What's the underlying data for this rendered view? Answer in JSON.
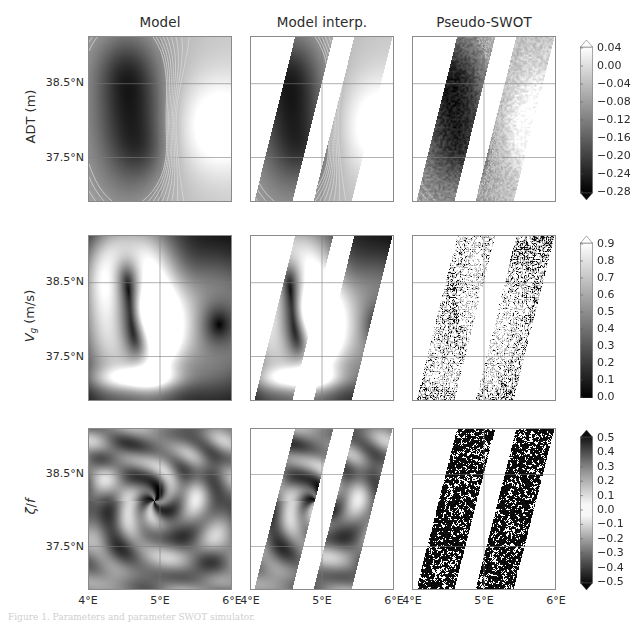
{
  "figure": {
    "width": 634,
    "height": 629,
    "background": "#ffffff",
    "caption": "Figure 1. Parameters and parameter SWOT simulator."
  },
  "columns": [
    {
      "id": "model",
      "title": "Model",
      "x": 88,
      "width": 144
    },
    {
      "id": "model-interp",
      "title": "Model interp.",
      "x": 250,
      "width": 144
    },
    {
      "id": "pseudo-swot",
      "title": "Pseudo-SWOT",
      "x": 412,
      "width": 144
    }
  ],
  "rows": [
    {
      "id": "adt",
      "label": "ADT (m)",
      "label_html": "ADT (m)",
      "y": 36,
      "height": 166,
      "variable": "ADT",
      "units": "m"
    },
    {
      "id": "vg",
      "label": "V_g (m/s)",
      "label_html": "<i>V</i><sub>g</sub> (m/s)",
      "y": 235,
      "height": 166,
      "variable": "Geostrophic velocity",
      "units": "m/s"
    },
    {
      "id": "zeta-f",
      "label": "ζ/f",
      "label_html": "<i>ζ</i>/<i>f</i>",
      "y": 428,
      "height": 162,
      "variable": "Relative vorticity over Coriolis",
      "units": ""
    }
  ],
  "axes": {
    "xticks": [
      {
        "label": "4°E",
        "value": 4,
        "frac": 0.0
      },
      {
        "label": "5°E",
        "value": 5,
        "frac": 0.5
      },
      {
        "label": "6°E",
        "value": 6,
        "frac": 1.0
      }
    ],
    "yticks": [
      {
        "label": "38.5°N",
        "value": 38.5,
        "frac": 0.285
      },
      {
        "label": "37.5°N",
        "value": 37.5,
        "frac": 0.735
      }
    ],
    "xlim": [
      4,
      6
    ],
    "ylim": [
      37.0,
      39.0
    ],
    "grid": true,
    "grid_color": "#7d7d7d"
  },
  "colorbars": [
    {
      "id": "cbar-adt",
      "row": "adt",
      "x": 580,
      "y": 40,
      "width": 13,
      "height": 160,
      "extend": "both",
      "vmin": -0.3,
      "vmax": 0.06,
      "cmap": "gray",
      "ticks": [
        "0.04",
        "0.00",
        "−0.04",
        "−0.08",
        "−0.12",
        "−0.16",
        "−0.20",
        "−0.24",
        "−0.28"
      ],
      "tick_values": [
        0.04,
        0.0,
        -0.04,
        -0.08,
        -0.12,
        -0.16,
        -0.2,
        -0.24,
        -0.28
      ]
    },
    {
      "id": "cbar-vg",
      "row": "vg",
      "x": 580,
      "y": 236,
      "width": 13,
      "height": 162,
      "extend": "max",
      "vmin": 0.0,
      "vmax": 0.95,
      "cmap": "gray",
      "ticks": [
        "0.9",
        "0.8",
        "0.7",
        "0.6",
        "0.5",
        "0.4",
        "0.3",
        "0.2",
        "0.1",
        "0.0"
      ],
      "tick_values": [
        0.9,
        0.8,
        0.7,
        0.6,
        0.5,
        0.4,
        0.3,
        0.2,
        0.1,
        0.0
      ]
    },
    {
      "id": "cbar-zeta",
      "row": "zeta-f",
      "x": 580,
      "y": 430,
      "width": 13,
      "height": 160,
      "extend": "both",
      "vmin": -0.55,
      "vmax": 0.55,
      "cmap": "gray-diverging",
      "ticks": [
        "0.5",
        "0.4",
        "0.3",
        "0.2",
        "0.1",
        "0.0",
        "−0.1",
        "−0.2",
        "−0.3",
        "−0.4",
        "−0.5"
      ],
      "tick_values": [
        0.5,
        0.4,
        0.3,
        0.2,
        0.1,
        0.0,
        -0.1,
        -0.2,
        -0.3,
        -0.4,
        -0.5
      ]
    }
  ],
  "chart_data": {
    "type": "heatmap",
    "title": "",
    "xlabel": "Longitude",
    "ylabel": "Latitude",
    "xlim": [
      4,
      6
    ],
    "ylim": [
      37.0,
      39.0
    ],
    "grid": true,
    "legend_position": "right-colorbars",
    "row_variables": [
      "ADT (m)",
      "V_g (m/s)",
      "ζ/f"
    ],
    "column_products": [
      "Model",
      "Model interp.",
      "Pseudo-SWOT"
    ],
    "swath": {
      "tilt_deg": 16,
      "left_swath_center_frac": 0.3,
      "right_swath_center_frac": 0.72,
      "swath_width_frac": 0.27,
      "nadir_gap_frac": 0.09,
      "description": "Two parallel SWOT KaRIn swaths tilted ~16 degrees from vertical with a nadir gap between them; area outside the swaths is blank white."
    },
    "series": [
      {
        "name": "ADT (m)",
        "vmin": -0.3,
        "vmax": 0.06,
        "contour_levels": [
          -0.28,
          -0.24,
          -0.2,
          -0.16,
          -0.12,
          -0.08,
          -0.04,
          0.0,
          0.04
        ],
        "field_note": "Broad negative (dark) cyclonic low centered near 4.6E between 37.4N and 38.9N; positive (light) maximum near 5.8E 38.0N.",
        "min_value": -0.3,
        "max_value": 0.05
      },
      {
        "name": "V_g (m/s)",
        "vmin": 0.0,
        "vmax": 0.95,
        "field_note": "Dark (weak) interior with a bright ring/jet of speeds up to ~0.9 m/s around the eddy rim and a filament near 4.9E 37.9N.",
        "min_value": 0.0,
        "max_value": 0.9
      },
      {
        "name": "ζ/f",
        "vmin": -0.55,
        "vmax": 0.55,
        "field_note": "Fine filamentary positive/negative vorticity spiral centered near 4.9E 38.1N; Pseudo-SWOT version is dominated by instrument noise.",
        "min_value": -0.5,
        "max_value": 0.5
      }
    ],
    "noise_note": "The Pseudo-SWOT column adds KaRIn instrument noise, producing dense speckle in ADT contours and fully noise-dominated Vg and zeta/f fields."
  }
}
